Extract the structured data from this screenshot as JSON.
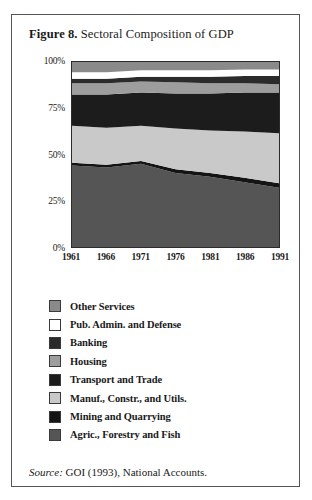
{
  "figure": {
    "label": "Figure 8.",
    "title": " Sectoral Composition of GDP",
    "source_label": "Source:",
    "source_text": " GOI (1993), National Accounts."
  },
  "legend": {
    "items": [
      {
        "label": "Other Services",
        "color": "#8a8a8a"
      },
      {
        "label": "Pub. Admin. and Defense",
        "color": "#ffffff"
      },
      {
        "label": "Banking",
        "color": "#2b2b2b"
      },
      {
        "label": "Housing",
        "color": "#9d9d9d"
      },
      {
        "label": "Transport and Trade",
        "color": "#1c1c1c"
      },
      {
        "label": "Manuf., Constr., and Utils.",
        "color": "#c9c9c9"
      },
      {
        "label": "Mining and Quarrying",
        "color": "#141414"
      },
      {
        "label": "Agric., Forestry and Fish",
        "color": "#555555"
      }
    ]
  },
  "chart_data": {
    "type": "area",
    "title": "Sectoral Composition of GDP",
    "xlabel": "",
    "ylabel": "",
    "stacked": true,
    "normalized": true,
    "grid": false,
    "legend_position": "below",
    "ylim": [
      0,
      100
    ],
    "yticks": [
      "0%",
      "25%",
      "50%",
      "75%",
      "100%"
    ],
    "ytick_values": [
      0,
      25,
      50,
      75,
      100
    ],
    "x": [
      1961,
      1966,
      1971,
      1976,
      1981,
      1986,
      1991
    ],
    "xticks": [
      "1961",
      "1966",
      "1971",
      "1976",
      "1981",
      "1986",
      "1991"
    ],
    "series": [
      {
        "name": "Agric., Forestry and Fish",
        "color": "#555555",
        "values": [
          44,
          43,
          45,
          40,
          38,
          35,
          32
        ]
      },
      {
        "name": "Mining and Quarrying",
        "color": "#141414",
        "values": [
          1.5,
          1.5,
          1.5,
          2,
          2,
          2.5,
          2.5
        ]
      },
      {
        "name": "Manuf., Constr., and Utils.",
        "color": "#c9c9c9",
        "values": [
          20,
          20,
          19,
          22,
          23,
          25,
          27
        ]
      },
      {
        "name": "Transport and Trade",
        "color": "#1c1c1c",
        "values": [
          17,
          18,
          18,
          19,
          20,
          21,
          22
        ]
      },
      {
        "name": "Housing",
        "color": "#9d9d9d",
        "values": [
          6,
          6,
          6,
          6,
          5.5,
          5,
          4.5
        ]
      },
      {
        "name": "Banking",
        "color": "#2b2b2b",
        "values": [
          2.5,
          2.5,
          2.5,
          3,
          3.5,
          4,
          4.5
        ]
      },
      {
        "name": "Pub. Admin. and Defense",
        "color": "#ffffff",
        "values": [
          3.5,
          3.5,
          3.5,
          3.5,
          3.5,
          3.5,
          3.5
        ]
      },
      {
        "name": "Other Services",
        "color": "#8a8a8a",
        "values": [
          5.5,
          5.5,
          4.5,
          4.5,
          4.5,
          4,
          4
        ]
      }
    ]
  }
}
